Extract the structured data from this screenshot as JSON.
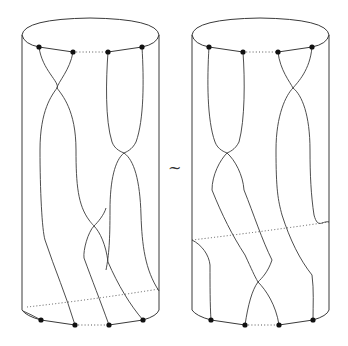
{
  "figure": {
    "type": "braid-cylinder-equivalence",
    "relation_symbol": "~",
    "left_cylinder": {
      "top_points": 4,
      "bottom_points": 4,
      "crossings": 3
    },
    "right_cylinder": {
      "top_points": 4,
      "bottom_points": 4,
      "crossings": 3
    },
    "colors": {
      "stroke": "#3a3a3a",
      "dot": "#111111",
      "background": "#ffffff"
    }
  }
}
